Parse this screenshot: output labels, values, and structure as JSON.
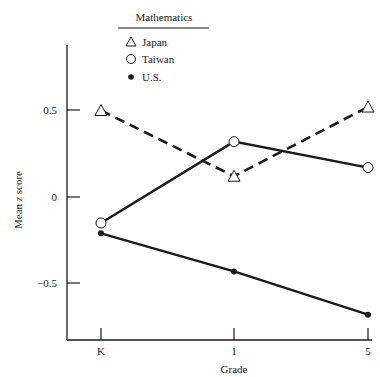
{
  "chart_data": {
    "type": "line",
    "title": "",
    "legend_title": "Mathematics",
    "xlabel": "Grade",
    "ylabel": "Mean z score",
    "categories": [
      "K",
      "1",
      "5"
    ],
    "yticks": [
      {
        "value": 0.5,
        "label": "0.5"
      },
      {
        "value": 0,
        "label": "0"
      },
      {
        "value": -0.5,
        "label": "−0.5"
      }
    ],
    "ylim": [
      -0.82,
      0.82
    ],
    "grid": false,
    "legend_position": "top-center",
    "series": [
      {
        "name": "Japan",
        "marker": "open-triangle",
        "line": "dashed",
        "values": [
          0.5,
          0.12,
          0.52
        ]
      },
      {
        "name": "Taiwan",
        "marker": "open-circle",
        "line": "solid",
        "values": [
          -0.15,
          0.32,
          0.17
        ]
      },
      {
        "name": "U.S.",
        "marker": "filled-circle",
        "line": "solid",
        "values": [
          -0.21,
          -0.43,
          -0.68
        ]
      }
    ]
  },
  "legend": {
    "title": "Mathematics",
    "items": [
      {
        "label": "Japan",
        "icon": "open-triangle-icon"
      },
      {
        "label": "Taiwan",
        "icon": "open-circle-icon"
      },
      {
        "label": "U.S.",
        "icon": "filled-circle-icon"
      }
    ]
  },
  "axes": {
    "xlabel": "Grade",
    "ylabel": "Mean z score",
    "ylabel_parts": {
      "pre": "Mean ",
      "italic": "z",
      "post": " score"
    },
    "xticks": [
      "K",
      "1",
      "5"
    ],
    "yticks": [
      "0.5",
      "0",
      "−0.5"
    ]
  },
  "colors": {
    "ink": "#1a1a1a",
    "background": "#ffffff"
  }
}
